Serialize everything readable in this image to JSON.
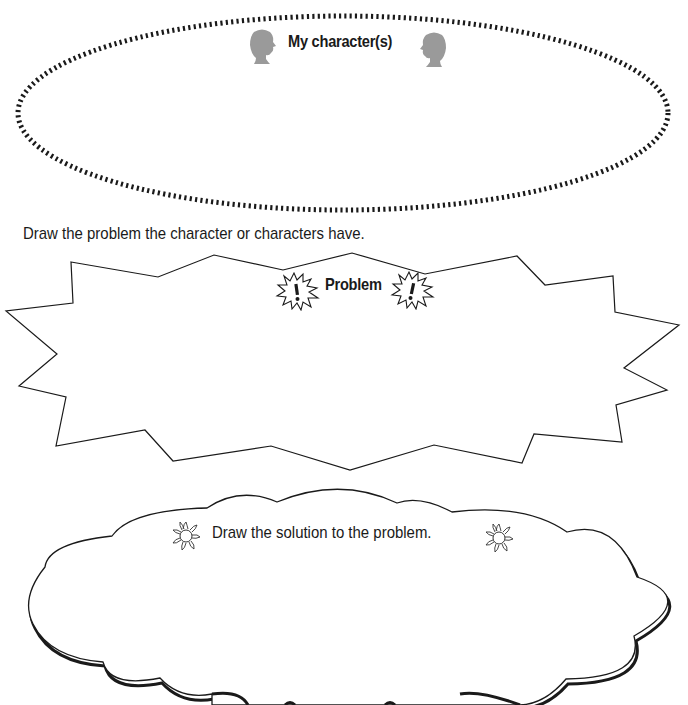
{
  "page": {
    "top_fragment": "'"
  },
  "characters": {
    "title": "My character(s)",
    "icons": [
      "head-silhouette-right-facing",
      "head-silhouette-left-facing"
    ],
    "icon_color": "#9a9a9a",
    "border_style": "dotted-ellipse"
  },
  "problem": {
    "instruction": "Draw the problem the character or characters have.",
    "title": "Problem",
    "icons": [
      "exclamation-burst-icon",
      "exclamation-burst-icon"
    ],
    "border_style": "jagged-burst"
  },
  "solution": {
    "title": "Draw the solution to the problem.",
    "icons": [
      "sun-icon",
      "sun-icon"
    ],
    "border_style": "cloud"
  },
  "colors": {
    "ink": "#1a1a1a",
    "silhouette": "#9a9a9a",
    "background": "#ffffff"
  }
}
